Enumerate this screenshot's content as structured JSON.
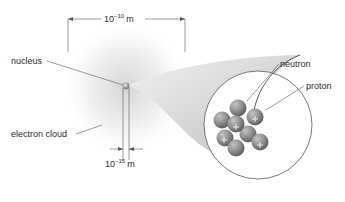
{
  "labels": {
    "nucleus": "nucleus",
    "electron_cloud": "electron cloud",
    "neutron": "neutron",
    "proton": "proton"
  },
  "dimensions": {
    "atom_size": {
      "base": "10",
      "exponent": "−10",
      "unit": "m"
    },
    "nucleus_size": {
      "base": "10",
      "exponent": "−15",
      "unit": "m"
    }
  },
  "colors": {
    "particle": "#8a8a8a",
    "cloud": "#d9d9d9",
    "line": "#555555"
  }
}
